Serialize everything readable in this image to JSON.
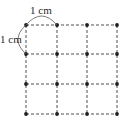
{
  "diagram": {
    "type": "dot-grid",
    "rows": 4,
    "cols": 4,
    "line_style": "dashed",
    "line_color": "#3a3a3a",
    "dot_color": "#1e1e1e",
    "grid_x": [
      26,
      57,
      87,
      117
    ],
    "grid_y": [
      25,
      54,
      84,
      114
    ],
    "labels": {
      "top": "1 cm",
      "left": "1 cm"
    }
  }
}
